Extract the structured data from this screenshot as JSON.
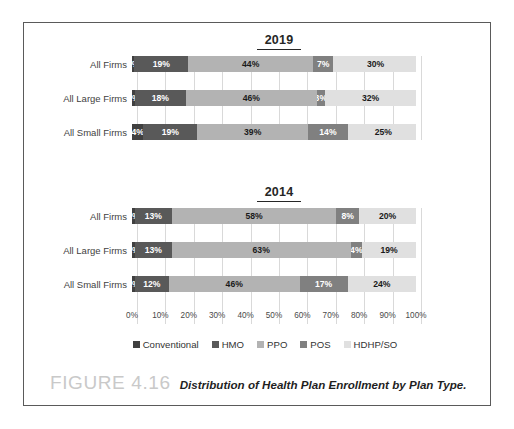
{
  "figure": {
    "number_label": "FIGURE 4.16",
    "caption": "Distribution of Health Plan Enrollment by Plan Type."
  },
  "legend": {
    "items": [
      {
        "label": "Conventional",
        "color": "#404040"
      },
      {
        "label": "HMO",
        "color": "#595959"
      },
      {
        "label": "PPO",
        "color": "#b3b3b3"
      },
      {
        "label": "POS",
        "color": "#808080"
      },
      {
        "label": "HDHP/SO",
        "color": "#e0e0e0"
      }
    ]
  },
  "axis": {
    "ticks": [
      "0%",
      "10%",
      "20%",
      "30%",
      "40%",
      "50%",
      "60%",
      "70%",
      "80%",
      "90%",
      "100%"
    ]
  },
  "panels": [
    {
      "title": "2019",
      "rows": [
        {
          "label": "All Firms",
          "segments": [
            {
              "series": "Conventional",
              "value": 0,
              "text": "0%"
            },
            {
              "series": "HMO",
              "value": 19,
              "text": "19%"
            },
            {
              "series": "PPO",
              "value": 44,
              "text": "44%"
            },
            {
              "series": "POS",
              "value": 7,
              "text": "7%"
            },
            {
              "series": "HDHP/SO",
              "value": 30,
              "text": "30%"
            }
          ]
        },
        {
          "label": "All Large Firms",
          "segments": [
            {
              "series": "Conventional",
              "value": 1,
              "text": "1%"
            },
            {
              "series": "HMO",
              "value": 18,
              "text": "18%"
            },
            {
              "series": "PPO",
              "value": 46,
              "text": "46%"
            },
            {
              "series": "POS",
              "value": 3,
              "text": "3%"
            },
            {
              "series": "HDHP/SO",
              "value": 32,
              "text": "32%"
            }
          ]
        },
        {
          "label": "All Small Firms",
          "segments": [
            {
              "series": "Conventional",
              "value": 4,
              "text": "4%"
            },
            {
              "series": "HMO",
              "value": 19,
              "text": "19%"
            },
            {
              "series": "PPO",
              "value": 39,
              "text": "39%"
            },
            {
              "series": "POS",
              "value": 14,
              "text": "14%"
            },
            {
              "series": "HDHP/SO",
              "value": 25,
              "text": "25%"
            }
          ]
        }
      ]
    },
    {
      "title": "2014",
      "rows": [
        {
          "label": "All Firms",
          "segments": [
            {
              "series": "Conventional",
              "value": 1,
              "text": "1%"
            },
            {
              "series": "HMO",
              "value": 13,
              "text": "13%"
            },
            {
              "series": "PPO",
              "value": 58,
              "text": "58%"
            },
            {
              "series": "POS",
              "value": 8,
              "text": "8%"
            },
            {
              "series": "HDHP/SO",
              "value": 20,
              "text": "20%"
            }
          ]
        },
        {
          "label": "All Large Firms",
          "segments": [
            {
              "series": "Conventional",
              "value": 1,
              "text": "1%"
            },
            {
              "series": "HMO",
              "value": 13,
              "text": "13%"
            },
            {
              "series": "PPO",
              "value": 63,
              "text": "63%"
            },
            {
              "series": "POS",
              "value": 4,
              "text": "4%"
            },
            {
              "series": "HDHP/SO",
              "value": 19,
              "text": "19%"
            }
          ]
        },
        {
          "label": "All Small Firms",
          "segments": [
            {
              "series": "Conventional",
              "value": 1,
              "text": "1%"
            },
            {
              "series": "HMO",
              "value": 12,
              "text": "12%"
            },
            {
              "series": "PPO",
              "value": 46,
              "text": "46%"
            },
            {
              "series": "POS",
              "value": 17,
              "text": "17%"
            },
            {
              "series": "HDHP/SO",
              "value": 24,
              "text": "24%"
            }
          ]
        }
      ]
    }
  ],
  "chart_data": {
    "type": "bar",
    "orientation": "horizontal",
    "stacked": true,
    "normalized_to_percent": true,
    "title": "Distribution of Health Plan Enrollment by Plan Type.",
    "xlabel": "",
    "ylabel": "",
    "xlim": [
      0,
      100
    ],
    "xticks": [
      0,
      10,
      20,
      30,
      40,
      50,
      60,
      70,
      80,
      90,
      100
    ],
    "xtick_labels": [
      "0%",
      "10%",
      "20%",
      "30%",
      "40%",
      "50%",
      "60%",
      "70%",
      "80%",
      "90%",
      "100%"
    ],
    "grid": true,
    "grid_axis": "x",
    "legend_position": "bottom",
    "legend_entries": [
      "Conventional",
      "HMO",
      "PPO",
      "POS",
      "HDHP/SO"
    ],
    "panels": [
      {
        "panel_title": "2019",
        "categories": [
          "All Firms",
          "All Large Firms",
          "All Small Firms"
        ],
        "series": [
          {
            "name": "Conventional",
            "color": "#404040",
            "values": [
              0,
              1,
              4
            ]
          },
          {
            "name": "HMO",
            "color": "#595959",
            "values": [
              19,
              18,
              19
            ]
          },
          {
            "name": "PPO",
            "color": "#b3b3b3",
            "values": [
              44,
              46,
              39
            ]
          },
          {
            "name": "POS",
            "color": "#808080",
            "values": [
              7,
              3,
              14
            ]
          },
          {
            "name": "HDHP/SO",
            "color": "#e0e0e0",
            "values": [
              30,
              32,
              25
            ]
          }
        ]
      },
      {
        "panel_title": "2014",
        "categories": [
          "All Firms",
          "All Large Firms",
          "All Small Firms"
        ],
        "series": [
          {
            "name": "Conventional",
            "color": "#404040",
            "values": [
              1,
              1,
              1
            ]
          },
          {
            "name": "HMO",
            "color": "#595959",
            "values": [
              13,
              13,
              12
            ]
          },
          {
            "name": "PPO",
            "color": "#b3b3b3",
            "values": [
              58,
              63,
              46
            ]
          },
          {
            "name": "POS",
            "color": "#808080",
            "values": [
              8,
              4,
              17
            ]
          },
          {
            "name": "HDHP/SO",
            "color": "#e0e0e0",
            "values": [
              20,
              19,
              24
            ]
          }
        ]
      }
    ]
  }
}
